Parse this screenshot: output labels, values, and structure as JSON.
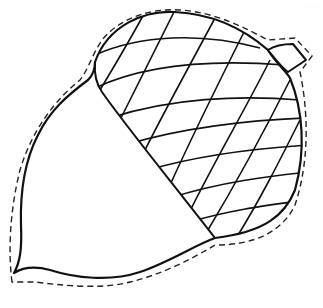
{
  "illustration": {
    "subject": "acorn",
    "style": "coloring-page line art",
    "parts": [
      "nut",
      "cap",
      "stem",
      "cut-line"
    ],
    "colors": {
      "background": "#ffffff",
      "line": "#111111",
      "cut_line": "#222222"
    }
  },
  "watermark": {
    "text": "...."
  }
}
